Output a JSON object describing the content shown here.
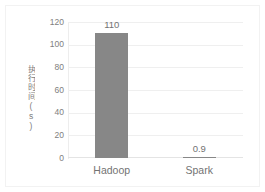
{
  "chart_data": {
    "type": "bar",
    "title": "",
    "subtitle": "",
    "xlabel": "",
    "ylabel": "执行时间(s)",
    "categories": [
      "Hadoop",
      "Spark"
    ],
    "values": [
      110,
      0.9
    ],
    "value_labels": [
      "110",
      "0.9"
    ],
    "series": [
      {
        "name": "执行时间(s)",
        "values": [
          110,
          0.9
        ],
        "color": "#878787"
      }
    ],
    "ylim": [
      0,
      120
    ],
    "y_ticks": [
      0,
      20,
      40,
      60,
      80,
      100,
      120
    ],
    "y_tick_labels": [
      "0",
      "20",
      "40",
      "60",
      "80",
      "100",
      "120"
    ],
    "grid": true,
    "grid_axis": "y",
    "legend": false,
    "legend_position": "none",
    "bar_color": "#878787",
    "text_color": "#737373",
    "tick_color": "#808080",
    "gridline_color": "#efefef",
    "background": "#ffffff"
  }
}
